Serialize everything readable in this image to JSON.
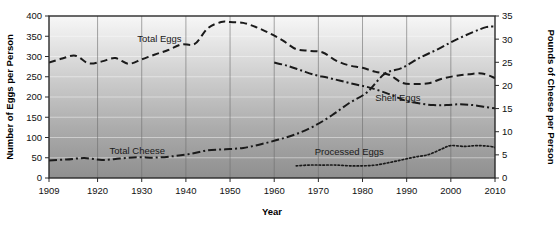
{
  "chart_data": {
    "type": "line",
    "title": "",
    "xlabel": "Year",
    "ylabel": "Number of Eggs per Person",
    "y2label": "Pounds of Cheese per Person",
    "xlim": [
      1909,
      2010
    ],
    "ylim": [
      0,
      400
    ],
    "y2lim": [
      0,
      35
    ],
    "grid": true,
    "legend_position": "inline-annotations",
    "xticks": [
      "1909",
      "1920",
      "1930",
      "1940",
      "1950",
      "1960",
      "1970",
      "1980",
      "1990",
      "2000",
      "2010"
    ],
    "xtick_values": [
      1909,
      1920,
      1930,
      1940,
      1950,
      1960,
      1970,
      1980,
      1990,
      2000,
      2010
    ],
    "yticks": [
      "0",
      "50",
      "100",
      "150",
      "200",
      "250",
      "300",
      "350",
      "400"
    ],
    "ytick_values": [
      0,
      50,
      100,
      150,
      200,
      250,
      300,
      350,
      400
    ],
    "y2ticks": [
      "0",
      "5",
      "10",
      "15",
      "20",
      "25",
      "30",
      "35"
    ],
    "y2tick_values": [
      0,
      5,
      10,
      15,
      20,
      25,
      30,
      35
    ],
    "series": [
      {
        "name": "Total Eggs",
        "axis": "left",
        "units": "eggs per person",
        "style": "dashed",
        "color": "#1a1a1a",
        "label_x": 1934,
        "label_y": 335,
        "x": [
          1909,
          1912,
          1915,
          1918,
          1921,
          1924,
          1927,
          1930,
          1933,
          1936,
          1939,
          1942,
          1945,
          1948,
          1950,
          1953,
          1956,
          1959,
          1962,
          1965,
          1968,
          1971,
          1974,
          1977,
          1980,
          1983,
          1986,
          1989,
          1992,
          1995,
          1998,
          2001,
          2004,
          2007,
          2010
        ],
        "values": [
          285,
          295,
          302,
          283,
          288,
          296,
          282,
          293,
          305,
          316,
          330,
          331,
          370,
          385,
          385,
          383,
          372,
          357,
          339,
          318,
          314,
          310,
          290,
          278,
          272,
          262,
          255,
          235,
          232,
          234,
          245,
          252,
          256,
          258,
          247
        ]
      },
      {
        "name": "Shell Eggs",
        "axis": "left",
        "units": "eggs per person",
        "style": "dash-dot",
        "color": "#1a1a1a",
        "label_x": 1988,
        "label_y": 190,
        "x": [
          1960,
          1963,
          1966,
          1969,
          1972,
          1975,
          1978,
          1981,
          1984,
          1987,
          1990,
          1993,
          1996,
          1999,
          2002,
          2005,
          2008,
          2010
        ],
        "values": [
          285,
          277,
          266,
          255,
          248,
          240,
          232,
          225,
          215,
          203,
          190,
          184,
          180,
          180,
          182,
          180,
          175,
          172
        ]
      },
      {
        "name": "Processed Eggs",
        "axis": "left",
        "units": "eggs per person",
        "style": "dotted",
        "color": "#1a1a1a",
        "label_x": 1977,
        "label_y": 57,
        "x": [
          1965,
          1968,
          1971,
          1974,
          1977,
          1980,
          1983,
          1986,
          1989,
          1992,
          1995,
          1998,
          2000,
          2003,
          2006,
          2009,
          2010
        ],
        "values": [
          30,
          32,
          32,
          32,
          30,
          30,
          32,
          38,
          45,
          52,
          58,
          72,
          80,
          78,
          80,
          78,
          75
        ]
      },
      {
        "name": "Total Cheese",
        "axis": "right",
        "units": "pounds per person",
        "style": "dash-dot",
        "color": "#1a1a1a",
        "label_x": 1929,
        "label_y_right": 5.2,
        "x": [
          1909,
          1913,
          1917,
          1921,
          1925,
          1929,
          1933,
          1937,
          1941,
          1945,
          1949,
          1953,
          1957,
          1961,
          1965,
          1969,
          1973,
          1977,
          1981,
          1985,
          1989,
          1993,
          1997,
          2001,
          2005,
          2008,
          2010
        ],
        "values": [
          3.8,
          4.0,
          4.3,
          3.9,
          4.2,
          4.5,
          4.4,
          4.7,
          5.2,
          6.0,
          6.2,
          6.5,
          7.3,
          8.3,
          9.5,
          11.2,
          13.5,
          16.2,
          18.5,
          22.5,
          23.8,
          26.0,
          27.8,
          29.8,
          31.5,
          32.6,
          32.7
        ]
      }
    ],
    "annotations": [
      {
        "text": "Total Eggs"
      },
      {
        "text": "Shell Eggs"
      },
      {
        "text": "Processed Eggs"
      },
      {
        "text": "Total Cheese"
      }
    ]
  }
}
